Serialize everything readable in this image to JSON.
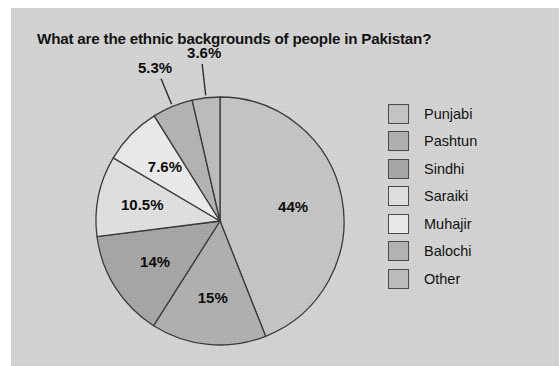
{
  "chart_data": {
    "type": "pie",
    "title": "What are the ethnic backgrounds of people in Pakistan?",
    "xlabel": "",
    "ylabel": "",
    "legend_position": "right",
    "grid": false,
    "start_angle_deg": 0,
    "direction": "clockwise",
    "categories": [
      "Punjabi",
      "Pashtun",
      "Sindhi",
      "Saraiki",
      "Muhajir",
      "Balochi",
      "Other"
    ],
    "values": [
      44,
      15,
      14,
      10.5,
      7.6,
      5.3,
      3.6
    ],
    "labels": [
      "44%",
      "15%",
      "14%",
      "10.5%",
      "7.6%",
      "5.3%",
      "3.6%"
    ],
    "colors": [
      "#c8c8c8",
      "#b3b3b3",
      "#a9a9a9",
      "#e4e4e4",
      "#efefef",
      "#b6b6b6",
      "#c0c0c0"
    ],
    "slice_line_color": "#3a3a3a",
    "label_placement": [
      "inside",
      "inside",
      "inside",
      "inside",
      "inside",
      "outside",
      "outside"
    ]
  },
  "legend": {
    "items": [
      {
        "label": "Punjabi",
        "color": "#c8c8c8"
      },
      {
        "label": "Pashtun",
        "color": "#b3b3b3"
      },
      {
        "label": "Sindhi",
        "color": "#a9a9a9"
      },
      {
        "label": "Saraiki",
        "color": "#e4e4e4"
      },
      {
        "label": "Muhajir",
        "color": "#efefef"
      },
      {
        "label": "Balochi",
        "color": "#b6b6b6"
      },
      {
        "label": "Other",
        "color": "#c0c0c0"
      }
    ]
  },
  "theme": {
    "panel_background": "#d7d7d7",
    "page_background": "#ffffff",
    "text_color": "#111111",
    "outline_color": "#3a3a3a"
  }
}
